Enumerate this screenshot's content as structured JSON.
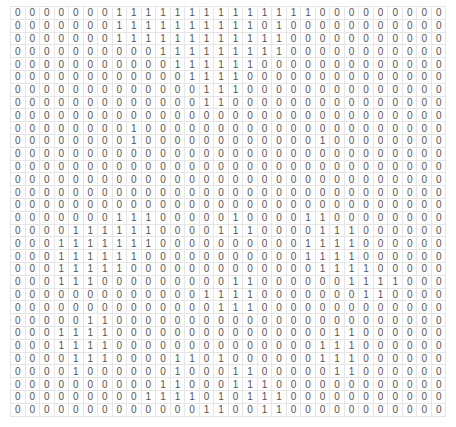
{
  "grid": {
    "rows": 32,
    "cols": 30,
    "text_color": "#555555",
    "border_color": "#e6e6e6",
    "values": [
      "000000011111111111111000000000",
      "000000011111111110100000000000",
      "000000011111111111100000000000",
      "000000000011111111100000000000",
      "000000000001111110000000000000",
      "000000000000111100000000000000",
      "000000000000011100000000000000",
      "000000000000011000000000000000",
      "000000000000000000000000000000",
      "000000001000000000000000000000",
      "000000001000000000000100000000",
      "000000000000000000000000000000",
      "000000000000000000000000000000",
      "000000000000000000000000000000",
      "000000000000000000000000000000",
      "000000000000000000000000000000",
      "000000011100000100001100000000",
      "000011111100001110000111000000",
      "000111111100000000001111000000",
      "000111111000000000001111000000",
      "000111110000000000000111100000",
      "000111000000000110000001111000",
      "000000000000011110000000110000",
      "000000000000001110000000000000",
      "000001100000000000000000000000",
      "000111100000000000000011000000",
      "000111100000000000000111000000",
      "000011100001101000000111000000",
      "000010000001000110000011000000",
      "000000000011000111000000000000",
      "000000000111101011100000000000",
      "000000000000011001100000000000"
    ]
  }
}
